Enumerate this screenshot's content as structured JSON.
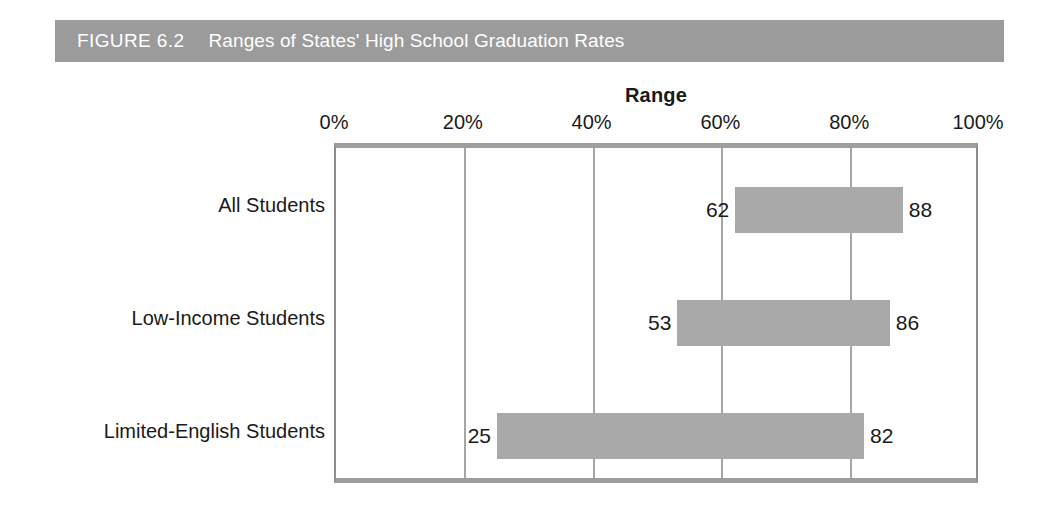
{
  "figure": {
    "label": "FIGURE 6.2",
    "title": "Ranges of States' High School Graduation Rates",
    "banner_color": "#9b9b9b",
    "banner_text_color": "#ffffff"
  },
  "chart_data": {
    "type": "bar",
    "orientation": "horizontal",
    "subtype": "range-bar",
    "title": "Ranges of States' High School Graduation Rates",
    "xlabel": "Range",
    "ylabel": "",
    "xlim": [
      0,
      100
    ],
    "xticks": [
      0,
      20,
      40,
      60,
      80,
      100
    ],
    "xtick_labels": [
      "0%",
      "20%",
      "40%",
      "60%",
      "80%",
      "100%"
    ],
    "grid": true,
    "legend": false,
    "bar_color": "#a9a9a9",
    "categories": [
      "All Students",
      "Low-Income Students",
      "Limited-English Students"
    ],
    "ranges": [
      {
        "category": "All Students",
        "low": 62,
        "high": 88,
        "low_label": "62",
        "high_label": "88"
      },
      {
        "category": "Low-Income Students",
        "low": 53,
        "high": 86,
        "low_label": "53",
        "high_label": "86"
      },
      {
        "category": "Limited-English Students",
        "low": 25,
        "high": 82,
        "low_label": "25",
        "high_label": "82"
      }
    ]
  }
}
